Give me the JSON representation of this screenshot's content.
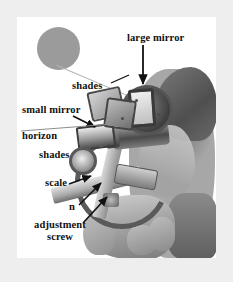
{
  "figure": {
    "background_color": "#eeeeee",
    "panel_color": "#ffffff",
    "sun_color": "#9b9b9b",
    "label_color": "#111111",
    "pointer_color": "#111111"
  },
  "labels": [
    {
      "id": "large-mirror",
      "text": "large mirror"
    },
    {
      "id": "shades-upper",
      "text": "shades"
    },
    {
      "id": "small-mirror",
      "text": "small mirror"
    },
    {
      "id": "horizon",
      "text": "horizon"
    },
    {
      "id": "shades-lower",
      "text": "shades"
    },
    {
      "id": "scale",
      "text": "scale"
    },
    {
      "id": "n",
      "text": "n"
    },
    {
      "id": "adjustment-screw",
      "text": "adjustment screw"
    }
  ],
  "subject": {
    "sun": "sun",
    "observer": "observer head in profile",
    "hand": "hand holding sextant",
    "instrument": "sextant"
  }
}
